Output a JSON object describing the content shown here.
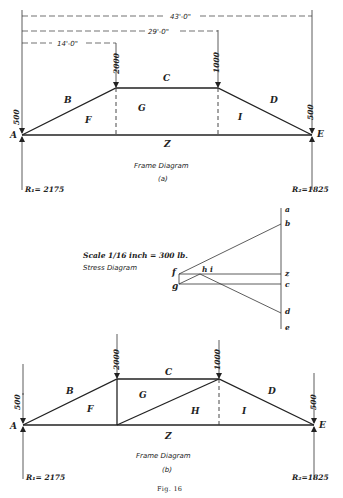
{
  "figure": {
    "caption": "Fig. 16",
    "diagram_a": {
      "title": "Frame Diagram",
      "sublabel": "(a)",
      "dimensions": {
        "total": "43'-0\"",
        "middle": "29'-0\"",
        "left": "14'-0\""
      },
      "loads": {
        "left_end": "500",
        "left_panel": "2000",
        "right_panel": "1000",
        "right_end": "500"
      },
      "spaces": {
        "B": "B",
        "C": "C",
        "D": "D",
        "F": "F",
        "G": "G",
        "I": "I",
        "Z": "Z"
      },
      "joints": {
        "A": "A",
        "E": "E"
      },
      "reactions": {
        "left": "R₁= 2175",
        "right": "R₂=1825"
      }
    },
    "stress_diagram": {
      "scale": "Scale 1/16 inch = 300 lb.",
      "title": "Stress Diagram",
      "points": {
        "a": "a",
        "b": "b",
        "z": "z",
        "c": "c",
        "d": "d",
        "e": "e",
        "f": "f",
        "g": "g",
        "hi": "h i"
      }
    },
    "diagram_b": {
      "title": "Frame Diagram",
      "sublabel": "(b)",
      "loads": {
        "left_end": "500",
        "left_panel": "2000",
        "right_panel": "1000",
        "right_end": "500"
      },
      "spaces": {
        "B": "B",
        "C": "C",
        "D": "D",
        "F": "F",
        "G": "G",
        "H": "H",
        "I": "I",
        "Z": "Z"
      },
      "joints": {
        "A": "A",
        "E": "E"
      },
      "reactions": {
        "left": "R₁= 2175",
        "right": "R₂=1825"
      }
    }
  }
}
